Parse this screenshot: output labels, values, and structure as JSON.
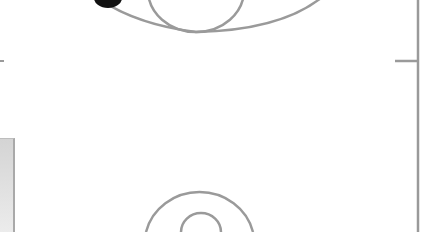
{
  "diagram": {
    "type": "basketball-half-court-segment",
    "line_color": "#9a9a9a",
    "panel_color": "#dcdcdc",
    "elements": {
      "three_point_arc": {
        "visible": true
      },
      "free_throw_circle": {
        "visible": true
      },
      "center_circle_outer": {
        "visible": true
      },
      "center_circle_inner": {
        "visible": true
      },
      "sideline_right": {
        "visible": true
      },
      "midcourt_tick_left": {
        "visible": true
      },
      "midcourt_tick_right": {
        "visible": true
      },
      "player_marker": {
        "color": "#111111",
        "visible": true
      },
      "bench_panel": {
        "visible": true
      }
    }
  }
}
